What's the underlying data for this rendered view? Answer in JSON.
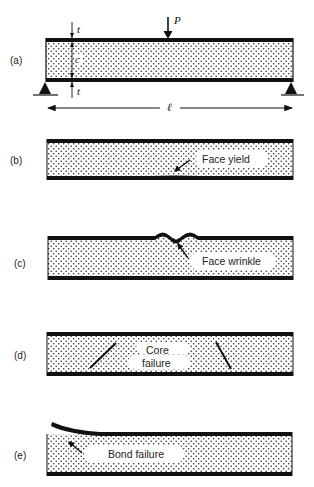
{
  "figure": {
    "panels": [
      {
        "id": "a",
        "label": "(a)",
        "description": "Sandwich beam in three-point bending"
      },
      {
        "id": "b",
        "label": "(b)",
        "failure": "Face yield"
      },
      {
        "id": "c",
        "label": "(c)",
        "failure": "Face wrinkle"
      },
      {
        "id": "d",
        "label": "(d)",
        "failure_line1": "Core",
        "failure_line2": "failure"
      },
      {
        "id": "e",
        "label": "(e)",
        "failure": "Bond failure"
      }
    ],
    "symbols": {
      "load": "P",
      "face_thickness": "t",
      "core_thickness": "c",
      "span": "ℓ"
    },
    "colors": {
      "ink": "#111111",
      "background": "#ffffff"
    }
  }
}
